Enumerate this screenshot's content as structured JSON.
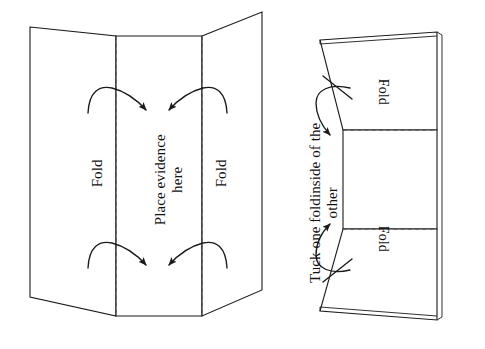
{
  "figure": {
    "background_color": "#ffffff",
    "line_color": "#1a1a1a",
    "text_color": "#111111"
  },
  "left_panel": {
    "name": "unfolded-sheet-diagram",
    "labels": {
      "fold_left": "Fold",
      "fold_right": "Fold",
      "place_evidence_line1": "Place evidence",
      "place_evidence_line2": "here",
      "place_evidence": "Place evidence here"
    },
    "arrows": [
      {
        "name": "arrow-top-left",
        "direction": "inward-right-down"
      },
      {
        "name": "arrow-top-right",
        "direction": "inward-left-down"
      },
      {
        "name": "arrow-bottom-left",
        "direction": "inward-right-down"
      },
      {
        "name": "arrow-bottom-right",
        "direction": "inward-left-down"
      }
    ],
    "fold_lines": [
      {
        "name": "fold-crease-left",
        "style": "dashed"
      },
      {
        "name": "fold-crease-right",
        "style": "dashed"
      }
    ]
  },
  "right_panel": {
    "name": "folded-sheet-diagram",
    "labels": {
      "fold_top": "Fold",
      "fold_bottom": "Fold",
      "tuck_line1": "Tuck one foldinside of the",
      "tuck_line2": "other",
      "tuck": "Tuck one foldinside of the other"
    },
    "arrows": [
      {
        "name": "arrow-tuck-top",
        "direction": "curve-down"
      },
      {
        "name": "arrow-tuck-bottom",
        "direction": "curve-up"
      }
    ],
    "fold_lines": [
      {
        "name": "fold-crease-top",
        "style": "dashed"
      },
      {
        "name": "fold-crease-bottom",
        "style": "dashed"
      }
    ]
  }
}
